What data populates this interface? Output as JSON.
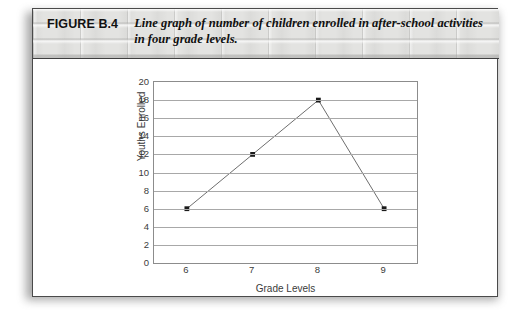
{
  "figure": {
    "number_label": "FIGURE B.4",
    "caption": "Line graph of number of children enrolled in after-school activities in four grade levels."
  },
  "chart_data": {
    "type": "line",
    "title": "",
    "xlabel": "Grade Levels",
    "ylabel": "Youths Enrolled",
    "categories": [
      "6",
      "7",
      "8",
      "9"
    ],
    "x": [
      6,
      7,
      8,
      9
    ],
    "values": [
      6,
      12,
      18,
      6
    ],
    "series": [
      {
        "name": "Youths Enrolled",
        "values": [
          6,
          12,
          18,
          6
        ]
      }
    ],
    "xlim": [
      5.5,
      9.5
    ],
    "ylim": [
      0,
      20
    ],
    "ytick_labels": [
      "20",
      "18",
      "16",
      "14",
      "12",
      "10",
      "8",
      "6",
      "4",
      "2",
      "0"
    ],
    "yticks": [
      20,
      18,
      16,
      14,
      12,
      10,
      8,
      6,
      4,
      2,
      0
    ],
    "xtick_labels": [
      "6",
      "7",
      "8",
      "9"
    ],
    "grid": "horizontal",
    "legend": "none",
    "line_color": "#6e6e6e",
    "marker_color": "#1a1a1a",
    "grid_color": "#a8a8a8",
    "frame_color": "#8c8c8c"
  }
}
